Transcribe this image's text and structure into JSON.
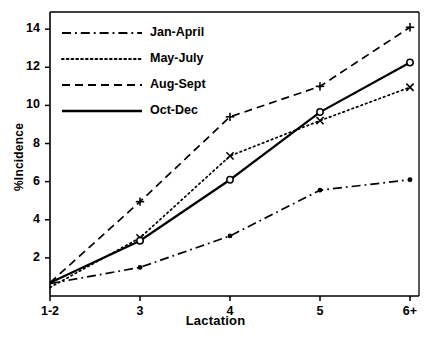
{
  "chart_data": {
    "type": "line",
    "title": "",
    "xlabel": "Lactation",
    "ylabel": "%Incidence",
    "categories": [
      "1-2",
      "3",
      "4",
      "5",
      "6+"
    ],
    "ylim": [
      0,
      14.9
    ],
    "yticks": [
      2,
      4,
      6,
      8,
      10,
      12,
      14
    ],
    "ytick_labels": [
      "2",
      "4",
      "6",
      "8",
      "10",
      "12",
      "14"
    ],
    "grid": false,
    "legend_position": "top-left",
    "series": [
      {
        "name": "Jan-April",
        "linestyle": "dashdot",
        "marker": "dot",
        "values": [
          0.65,
          1.5,
          3.15,
          5.55,
          6.1
        ]
      },
      {
        "name": "May-July",
        "linestyle": "dotted",
        "marker": "cross-x",
        "values": [
          0.45,
          3.05,
          7.35,
          9.2,
          10.95
        ]
      },
      {
        "name": "Aug-Sept",
        "linestyle": "dashed",
        "marker": "plus",
        "values": [
          0.7,
          4.95,
          9.4,
          11.0,
          14.1
        ]
      },
      {
        "name": "Oct-Dec",
        "linestyle": "solid",
        "marker": "circle",
        "values": [
          0.7,
          2.9,
          6.1,
          9.65,
          12.25
        ]
      }
    ]
  },
  "legend": {
    "items": [
      {
        "label": "Jan-April"
      },
      {
        "label": "May-July"
      },
      {
        "label": "Aug-Sept"
      },
      {
        "label": "Oct-Dec"
      }
    ]
  },
  "colors": {
    "ink": "#000000",
    "background": "#ffffff"
  }
}
